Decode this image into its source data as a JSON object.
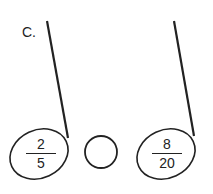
{
  "problem": {
    "label": "C.",
    "left_fraction": {
      "numerator": "2",
      "denominator": "5"
    },
    "right_fraction": {
      "numerator": "8",
      "denominator": "20"
    },
    "comparison_answer": ""
  },
  "colors": {
    "ink": "#222222",
    "background": "#ffffff"
  }
}
